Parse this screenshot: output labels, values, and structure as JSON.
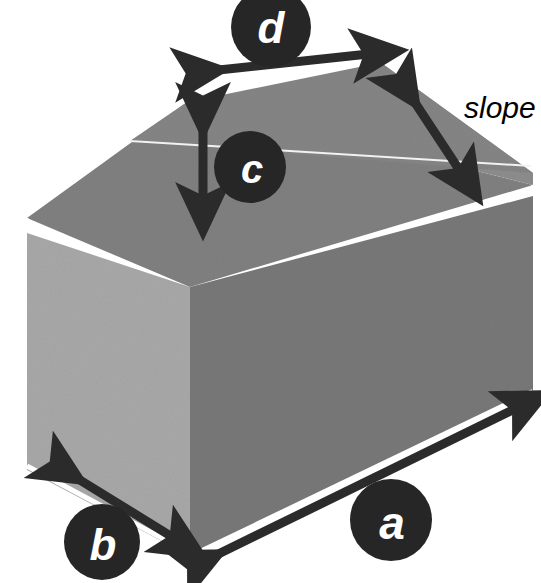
{
  "figure": {
    "background_color": "#ffffff",
    "width": 541,
    "height": 583
  },
  "solid": {
    "name": "house-prism",
    "faces": {
      "roof_front_color": "#808080",
      "roof_back_color": "#8d8d8d",
      "left_wall_color": "#a8a8a8",
      "right_wall_color": "#787878",
      "gable_color": "#9a9a9a",
      "edge_highlight_color": "#ffffff"
    }
  },
  "labels": {
    "badge_color": "#262626",
    "badge_text_color": "#ffffff",
    "a": "a",
    "b": "b",
    "c": "c",
    "d": "d",
    "slope": "slope"
  },
  "dimensions": [
    {
      "id": "a",
      "label": "a",
      "description": "length of base along the long bottom edge",
      "arrow_color": "#2b2b2b",
      "badge_center": [
        391,
        520
      ],
      "badge_radius": 41
    },
    {
      "id": "b",
      "label": "b",
      "description": "width of base along the short bottom edge",
      "arrow_color": "#2b2b2b",
      "badge_center": [
        102,
        542
      ],
      "badge_radius": 38
    },
    {
      "id": "c",
      "label": "c",
      "description": "vertical height of the gable (roof rise)",
      "arrow_color": "#2b2b2b",
      "badge_center": [
        250,
        167
      ],
      "badge_radius": 36
    },
    {
      "id": "d",
      "label": "d",
      "description": "width across the top of the roof ridge face",
      "arrow_color": "#2b2b2b",
      "badge_center": [
        271,
        27
      ],
      "badge_radius": 40
    },
    {
      "id": "slope",
      "label": "slope",
      "description": "slanted roof slope direction",
      "arrow_color": "#2b2b2b",
      "text_position": [
        464,
        118
      ]
    }
  ]
}
